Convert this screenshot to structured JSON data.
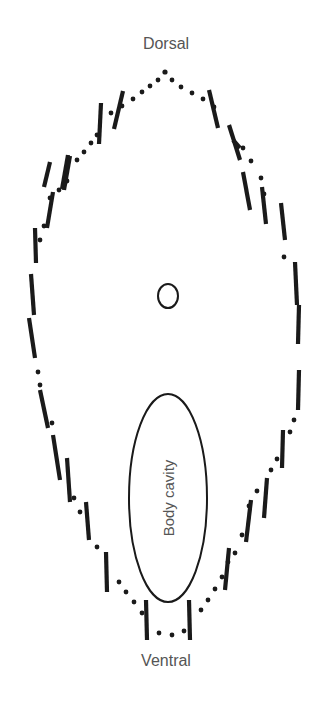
{
  "diagram": {
    "title_top": "Dorsal",
    "title_bottom": "Ventral",
    "cavity_label": "Body cavity",
    "colors": {
      "outline": "#1a1a1a",
      "text": "#555555",
      "background": "#ffffff"
    },
    "elements": {
      "outline_shape": "dotted-oval-with-scale-marks",
      "center_marker": "small-circle",
      "cavity_shape": "vertical-ellipse"
    }
  }
}
